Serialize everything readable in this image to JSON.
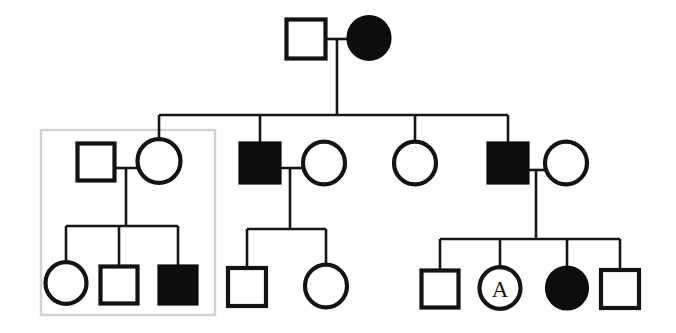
{
  "figure": {
    "type": "pedigree-chart",
    "title": "",
    "width": 676,
    "height": 333,
    "background_color": "#ffffff",
    "line_color": "#161616",
    "affected_fill_color": "#0d0d0d",
    "unaffected_fill_color": "#ffffff",
    "highlight_box_color": "#d2d2d2"
  },
  "legend_semantics": {
    "square": "male",
    "circle": "female",
    "filled": "affected",
    "open": "unaffected",
    "letter_label": "individual annotation"
  },
  "highlight_box": {
    "label": "highlighted-family-group",
    "x": 41,
    "y": 130,
    "width": 174,
    "height": 185
  },
  "generations": [
    {
      "id": "generation-1",
      "individuals": [
        {
          "id": "I-1",
          "shape": "square",
          "sex": "male",
          "affected": false,
          "label": "",
          "cx": 306,
          "cy": 39,
          "size": 39
        },
        {
          "id": "I-2",
          "shape": "circle",
          "sex": "female",
          "affected": true,
          "label": "",
          "cx": 369,
          "cy": 38,
          "size": 42
        }
      ]
    },
    {
      "id": "generation-2",
      "individuals": [
        {
          "id": "II-1",
          "shape": "square",
          "sex": "male",
          "affected": false,
          "label": "",
          "cx": 96,
          "cy": 162,
          "size": 37
        },
        {
          "id": "II-2",
          "shape": "circle",
          "sex": "female",
          "affected": false,
          "label": "",
          "cx": 159,
          "cy": 161,
          "size": 43
        },
        {
          "id": "II-3",
          "shape": "square",
          "sex": "male",
          "affected": true,
          "label": "",
          "cx": 260,
          "cy": 163,
          "size": 40
        },
        {
          "id": "II-4",
          "shape": "circle",
          "sex": "female",
          "affected": false,
          "label": "",
          "cx": 324,
          "cy": 163,
          "size": 42
        },
        {
          "id": "II-5",
          "shape": "circle",
          "sex": "female",
          "affected": false,
          "label": "",
          "cx": 415,
          "cy": 163,
          "size": 42
        },
        {
          "id": "II-6",
          "shape": "square",
          "sex": "male",
          "affected": true,
          "label": "",
          "cx": 508,
          "cy": 163,
          "size": 40
        },
        {
          "id": "II-7",
          "shape": "circle",
          "sex": "female",
          "affected": false,
          "label": "",
          "cx": 566,
          "cy": 163,
          "size": 42
        }
      ]
    },
    {
      "id": "generation-3",
      "individuals": [
        {
          "id": "III-1",
          "shape": "circle",
          "sex": "female",
          "affected": false,
          "label": "",
          "cx": 66,
          "cy": 283,
          "size": 41
        },
        {
          "id": "III-2",
          "shape": "square",
          "sex": "male",
          "affected": false,
          "label": "",
          "cx": 119,
          "cy": 285,
          "size": 37
        },
        {
          "id": "III-3",
          "shape": "square",
          "sex": "male",
          "affected": true,
          "label": "",
          "cx": 178,
          "cy": 285,
          "size": 38
        },
        {
          "id": "III-4",
          "shape": "square",
          "sex": "male",
          "affected": false,
          "label": "",
          "cx": 247,
          "cy": 287,
          "size": 38
        },
        {
          "id": "III-5",
          "shape": "circle",
          "sex": "female",
          "affected": false,
          "label": "",
          "cx": 326,
          "cy": 286,
          "size": 42
        },
        {
          "id": "III-6",
          "shape": "square",
          "sex": "male",
          "affected": false,
          "label": "",
          "cx": 440,
          "cy": 289,
          "size": 37
        },
        {
          "id": "III-7",
          "shape": "circle",
          "sex": "female",
          "affected": false,
          "label": "A",
          "cx": 500,
          "cy": 288,
          "size": 41
        },
        {
          "id": "III-8",
          "shape": "circle",
          "sex": "female",
          "affected": true,
          "label": "",
          "cx": 567,
          "cy": 288,
          "size": 41
        },
        {
          "id": "III-9",
          "shape": "square",
          "sex": "male",
          "affected": false,
          "label": "",
          "cx": 620,
          "cy": 289,
          "size": 38
        }
      ]
    }
  ],
  "mate_lines": [
    {
      "id": "mate-I1-I2",
      "x1": 326,
      "y1": 39,
      "x2": 348,
      "y2": 39
    },
    {
      "id": "mate-II1-II2",
      "x1": 115,
      "y1": 168,
      "x2": 138,
      "y2": 168
    },
    {
      "id": "mate-II3-II4",
      "x1": 280,
      "y1": 168,
      "x2": 303,
      "y2": 168
    },
    {
      "id": "mate-II6-II7",
      "x1": 528,
      "y1": 170,
      "x2": 545,
      "y2": 170
    }
  ],
  "descent_lines": [
    {
      "id": "descent-gen1-drop",
      "x1": 337,
      "y1": 39,
      "x2": 337,
      "y2": 115
    },
    {
      "id": "sibship-bar-gen2",
      "x1": 159,
      "y1": 115,
      "x2": 508,
      "y2": 115
    },
    {
      "id": "drop-II2",
      "x1": 159,
      "y1": 115,
      "x2": 159,
      "y2": 140
    },
    {
      "id": "drop-II3",
      "x1": 260,
      "y1": 115,
      "x2": 260,
      "y2": 143
    },
    {
      "id": "drop-II5",
      "x1": 415,
      "y1": 115,
      "x2": 415,
      "y2": 142
    },
    {
      "id": "drop-II6",
      "x1": 508,
      "y1": 115,
      "x2": 508,
      "y2": 143
    },
    {
      "id": "couple-drop-left",
      "x1": 126,
      "y1": 168,
      "x2": 126,
      "y2": 226
    },
    {
      "id": "sibship-bar-left",
      "x1": 66,
      "y1": 226,
      "x2": 178,
      "y2": 226
    },
    {
      "id": "drop-III1",
      "x1": 66,
      "y1": 226,
      "x2": 66,
      "y2": 262
    },
    {
      "id": "drop-III2",
      "x1": 119,
      "y1": 226,
      "x2": 119,
      "y2": 266
    },
    {
      "id": "drop-III3",
      "x1": 178,
      "y1": 226,
      "x2": 178,
      "y2": 266
    },
    {
      "id": "couple-drop-middle",
      "x1": 290,
      "y1": 168,
      "x2": 290,
      "y2": 229
    },
    {
      "id": "sibship-bar-middle",
      "x1": 247,
      "y1": 229,
      "x2": 326,
      "y2": 229
    },
    {
      "id": "drop-III4",
      "x1": 247,
      "y1": 229,
      "x2": 247,
      "y2": 268
    },
    {
      "id": "drop-III5",
      "x1": 326,
      "y1": 229,
      "x2": 326,
      "y2": 265
    },
    {
      "id": "couple-drop-right",
      "x1": 536,
      "y1": 170,
      "x2": 536,
      "y2": 239
    },
    {
      "id": "sibship-bar-right",
      "x1": 440,
      "y1": 239,
      "x2": 620,
      "y2": 239
    },
    {
      "id": "drop-III6",
      "x1": 440,
      "y1": 239,
      "x2": 440,
      "y2": 270
    },
    {
      "id": "drop-III7",
      "x1": 500,
      "y1": 239,
      "x2": 500,
      "y2": 267
    },
    {
      "id": "drop-III8",
      "x1": 567,
      "y1": 239,
      "x2": 567,
      "y2": 267
    },
    {
      "id": "drop-III9",
      "x1": 620,
      "y1": 239,
      "x2": 620,
      "y2": 270
    }
  ]
}
